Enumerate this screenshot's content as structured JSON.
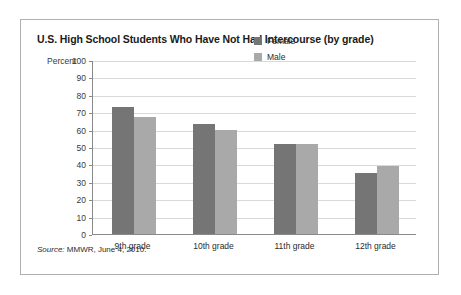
{
  "figure": {
    "title": "U.S. High School Students Who Have Not Had Intercourse (by grade)",
    "source_prefix": "Source:",
    "source_text": "MMWR, June 4, 2010."
  },
  "legend": {
    "items": [
      {
        "label": "Female",
        "color": "#757575"
      },
      {
        "label": "Male",
        "color": "#a9a9a9"
      }
    ]
  },
  "chart_data": {
    "type": "bar",
    "title": "U.S. High School Students Who Have Not Had Intercourse (by grade)",
    "xlabel": "",
    "ylabel": "Percent",
    "ylim": [
      0,
      100
    ],
    "yticks": [
      0,
      10,
      20,
      30,
      40,
      50,
      60,
      70,
      80,
      90,
      100
    ],
    "ytick_labels": [
      "0",
      "10",
      "20",
      "30",
      "40",
      "50",
      "60",
      "70",
      "80",
      "90",
      "100"
    ],
    "grid": true,
    "legend_position": "upper right",
    "categories": [
      "9th grade",
      "10th grade",
      "11th grade",
      "12th grade"
    ],
    "series": [
      {
        "name": "Female",
        "color": "#757575",
        "values": [
          73,
          63,
          52,
          35
        ]
      },
      {
        "name": "Male",
        "color": "#a9a9a9",
        "values": [
          67,
          60,
          52,
          39
        ]
      }
    ]
  }
}
